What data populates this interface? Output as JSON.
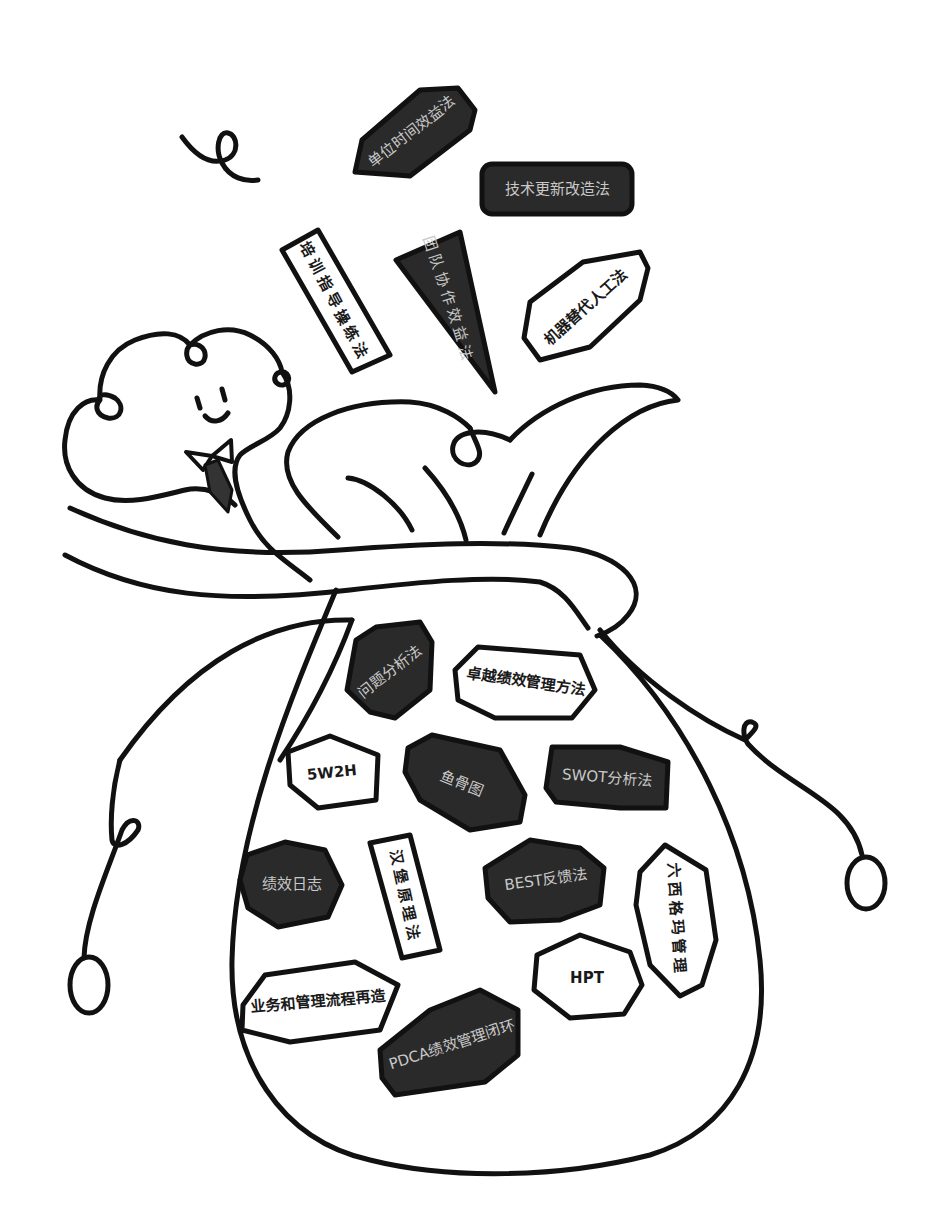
{
  "colors": {
    "line": "#111111",
    "dark_fill": "#2a2a2a",
    "dark_text": "#c8c8c8",
    "light_fill": "#ffffff",
    "light_text": "#1a1a1a"
  },
  "flying_methods": [
    {
      "label": "单位时间效益法",
      "style": "dark"
    },
    {
      "label": "技术更新改造法",
      "style": "dark"
    },
    {
      "label": "培训指导操练法",
      "style": "light"
    },
    {
      "label": "团队协作效益法",
      "style": "dark"
    },
    {
      "label": "机器替代人工法",
      "style": "light"
    }
  ],
  "bag_methods": [
    {
      "label": "问题分析法",
      "style": "dark"
    },
    {
      "label": "卓越绩效管理方法",
      "style": "light"
    },
    {
      "label": "5W2H",
      "style": "light"
    },
    {
      "label": "鱼骨图",
      "style": "dark"
    },
    {
      "label": "SWOT分析法",
      "style": "dark"
    },
    {
      "label": "绩效日志",
      "style": "dark"
    },
    {
      "label": "汉堡原理法",
      "style": "light"
    },
    {
      "label": "BEST反馈法",
      "style": "dark"
    },
    {
      "label": "六西格玛管理",
      "style": "light"
    },
    {
      "label": "HPT",
      "style": "light"
    },
    {
      "label": "业务和管理流程再造",
      "style": "light"
    },
    {
      "label": "PDCA绩效管理闭环",
      "style": "dark"
    }
  ]
}
